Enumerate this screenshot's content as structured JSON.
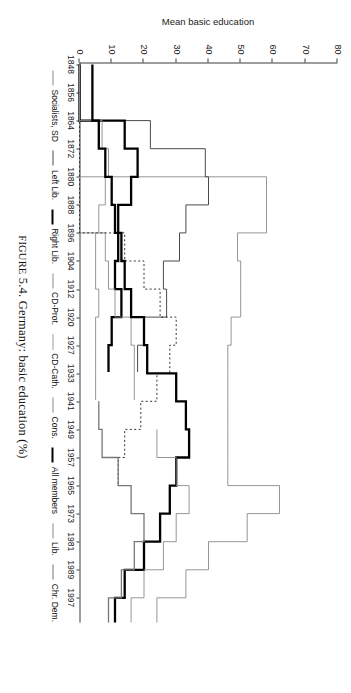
{
  "figure": {
    "caption_prefix": "Figure 5.4.",
    "caption_text": "Germany: basic education (%)",
    "caption_full": "FIGURE 5.4. Germany: basic education (%)"
  },
  "axes": {
    "y_title": "Mean basic education",
    "y_ticks": [
      "0",
      "10",
      "20",
      "30",
      "40",
      "50",
      "60",
      "70",
      "80"
    ],
    "x_ticks": [
      "1848",
      "1856",
      "1864",
      "1872",
      "1880",
      "1888",
      "1896",
      "1904",
      "1912",
      "1920",
      "1927",
      "1933",
      "1941",
      "1949",
      "1957",
      "1965",
      "1973",
      "1981",
      "1989",
      "1997"
    ]
  },
  "legend": {
    "items": [
      {
        "label": "Socialists, SD",
        "style": "thin-gray"
      },
      {
        "label": "Left Lib.",
        "style": "thin-dark"
      },
      {
        "label": "Right Lib.",
        "style": "thick-black"
      },
      {
        "label": "CD-Prot.",
        "style": "thin-gray"
      },
      {
        "label": "CD-Cath.",
        "style": "dotted"
      },
      {
        "label": "Cons.",
        "style": "thin-gray"
      },
      {
        "label": "All members",
        "style": "thick-black"
      },
      {
        "label": "Lib.",
        "style": "thin-gray"
      },
      {
        "label": "Chr. Dem.",
        "style": "med-gray"
      }
    ]
  },
  "chart_data": {
    "type": "line",
    "title": "Germany: basic education (%)",
    "xlabel": "",
    "ylabel": "Mean basic education",
    "ylim": [
      0,
      80
    ],
    "grid": false,
    "legend_position": "top",
    "step": "post",
    "x": [
      1848,
      1856,
      1864,
      1872,
      1880,
      1888,
      1896,
      1904,
      1912,
      1920,
      1927,
      1933,
      1941,
      1949,
      1957,
      1965,
      1973,
      1981,
      1989,
      1997
    ],
    "series": [
      {
        "name": "Socialists, SD",
        "style": "thin-gray",
        "values": [
          0,
          0,
          0,
          0,
          58,
          58,
          49,
          50,
          50,
          47,
          46,
          46,
          46,
          46,
          46,
          62,
          52,
          40,
          33,
          24
        ]
      },
      {
        "name": "Left Lib.",
        "style": "thin-dark",
        "values": [
          0,
          0,
          22,
          39,
          40,
          33,
          31,
          26,
          27,
          20,
          18,
          null,
          null,
          null,
          null,
          null,
          null,
          null,
          null,
          null
        ]
      },
      {
        "name": "Right Lib.",
        "style": "thick-black",
        "values": [
          0,
          0,
          14,
          18,
          16,
          12,
          12,
          11,
          13,
          10,
          9,
          null,
          null,
          null,
          null,
          null,
          null,
          null,
          null,
          null
        ]
      },
      {
        "name": "CD-Prot.",
        "style": "thin-gray",
        "values": [
          0,
          0,
          0,
          0,
          0,
          0,
          8,
          9,
          11,
          16,
          17,
          17,
          null,
          null,
          null,
          null,
          null,
          null,
          null,
          null
        ]
      },
      {
        "name": "CD-Cath.",
        "style": "dotted",
        "values": [
          0,
          0,
          0,
          0,
          0,
          0,
          14,
          20,
          25,
          30,
          28,
          24,
          19,
          14,
          12,
          null,
          null,
          null,
          null,
          null
        ]
      },
      {
        "name": "Cons.",
        "style": "thin-gray",
        "values": [
          0,
          0,
          7,
          9,
          8,
          6,
          5,
          5,
          6,
          5,
          5,
          5,
          null,
          null,
          null,
          null,
          null,
          null,
          null,
          null
        ]
      },
      {
        "name": "All members",
        "style": "thick-black",
        "values": [
          4,
          4,
          6,
          8,
          10,
          11,
          13,
          14,
          16,
          20,
          21,
          30,
          33,
          34,
          30,
          28,
          25,
          20,
          14,
          11
        ]
      },
      {
        "name": "Lib.",
        "style": "thin-gray",
        "values": [
          null,
          null,
          null,
          null,
          null,
          null,
          null,
          null,
          null,
          null,
          null,
          null,
          null,
          24,
          30,
          34,
          30,
          26,
          20,
          16
        ]
      },
      {
        "name": "Chr. Dem.",
        "style": "med-gray",
        "values": [
          null,
          null,
          null,
          null,
          null,
          null,
          null,
          null,
          null,
          null,
          null,
          null,
          6,
          7,
          12,
          16,
          20,
          17,
          13,
          9
        ]
      }
    ]
  }
}
